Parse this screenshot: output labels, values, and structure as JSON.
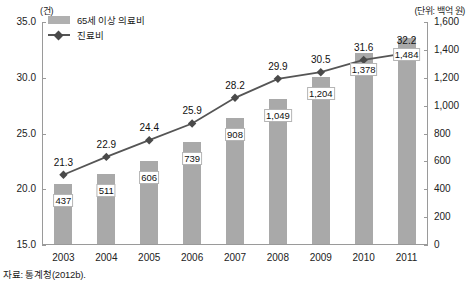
{
  "chart_data": {
    "type": "bar",
    "title": "",
    "categories": [
      "2003",
      "2004",
      "2005",
      "2006",
      "2007",
      "2008",
      "2009",
      "2010",
      "2011"
    ],
    "xlabel": "",
    "grid": false,
    "legend_position": "top-left",
    "unit_left": "(건)",
    "unit_right": "(단위: 백억 원)",
    "source": "자료: 통계청(2012b).",
    "axis_left": {
      "label": "(건)",
      "ylim": [
        15.0,
        35.0
      ],
      "ticks": [
        "15.0",
        "20.0",
        "25.0",
        "30.0",
        "35.0"
      ],
      "tick_values": [
        15.0,
        20.0,
        25.0,
        30.0,
        35.0
      ]
    },
    "axis_right": {
      "label": "(단위: 백억 원)",
      "ylim": [
        0,
        1600
      ],
      "ticks": [
        "0",
        "200",
        "400",
        "600",
        "800",
        "1,000",
        "1,200",
        "1,400",
        "1,600"
      ],
      "tick_values": [
        0,
        200,
        400,
        600,
        800,
        1000,
        1200,
        1400,
        1600
      ]
    },
    "series": [
      {
        "name": "65세 이상 의료비",
        "type": "bar",
        "axis": "right",
        "color": "#a9a9a9",
        "values": [
          437,
          511,
          606,
          739,
          908,
          1049,
          1204,
          1378,
          1484
        ],
        "labels": [
          "437",
          "511",
          "606",
          "739",
          "908",
          "1,049",
          "1,204",
          "1,378",
          "1,484"
        ]
      },
      {
        "name": "진료비",
        "type": "line",
        "axis": "left",
        "color": "#555555",
        "marker": "diamond",
        "values": [
          21.3,
          22.9,
          24.4,
          25.9,
          28.2,
          29.9,
          30.5,
          31.6,
          32.2
        ],
        "labels": [
          "21.3",
          "22.9",
          "24.4",
          "25.9",
          "28.2",
          "29.9",
          "30.5",
          "31.6",
          "32.2"
        ]
      }
    ]
  },
  "legend": {
    "items": [
      {
        "label": "65세 이상 의료비",
        "marker": "bar-swatch"
      },
      {
        "label": "진료비",
        "marker": "line-diamond-swatch"
      }
    ]
  }
}
